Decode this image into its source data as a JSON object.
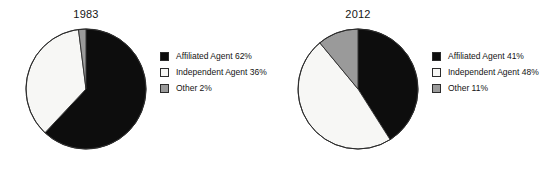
{
  "figure": {
    "background_color": "#ffffff",
    "palette": {
      "affiliated_agent": "#0d0d0d",
      "independent_agent": "#f7f7f5",
      "other": "#9a9a9a",
      "outline": "#2b2b2b",
      "text": "#141414"
    }
  },
  "chart_data": [
    {
      "type": "pie",
      "title": "1983",
      "xlabel": "",
      "ylabel": "",
      "grid": false,
      "legend_position": "right",
      "start_angle_clock": "12 o'clock",
      "direction": "clockwise",
      "labels": [
        "Affiliated Agent",
        "Independent Agent",
        "Other"
      ],
      "values": [
        62,
        36,
        2
      ],
      "units": "percent",
      "colors": [
        "#0d0d0d",
        "#f7f7f5",
        "#9a9a9a"
      ],
      "legend_entries": [
        "Affiliated Agent 62%",
        "Independent Agent 36%",
        "Other 2%"
      ],
      "slices": [
        {
          "label": "Affiliated Agent",
          "value": 62,
          "display": "Affiliated Agent 62%",
          "color": "#0d0d0d"
        },
        {
          "label": "Independent Agent",
          "value": 36,
          "display": "Independent Agent 36%",
          "color": "#f7f7f5"
        },
        {
          "label": "Other",
          "value": 2,
          "display": "Other 2%",
          "color": "#9a9a9a"
        }
      ]
    },
    {
      "type": "pie",
      "title": "2012",
      "xlabel": "",
      "ylabel": "",
      "grid": false,
      "legend_position": "right",
      "start_angle_clock": "12 o'clock",
      "direction": "clockwise",
      "labels": [
        "Affiliated Agent",
        "Independent Agent",
        "Other"
      ],
      "values": [
        41,
        48,
        11
      ],
      "units": "percent",
      "colors": [
        "#0d0d0d",
        "#f7f7f5",
        "#9a9a9a"
      ],
      "legend_entries": [
        "Affiliated Agent 41%",
        "Independent Agent 48%",
        "Other 11%"
      ],
      "slices": [
        {
          "label": "Affiliated Agent",
          "value": 41,
          "display": "Affiliated Agent 41%",
          "color": "#0d0d0d"
        },
        {
          "label": "Independent Agent",
          "value": 48,
          "display": "Independent Agent 48%",
          "color": "#f7f7f5"
        },
        {
          "label": "Other",
          "value": 11,
          "display": "Other 11%",
          "color": "#9a9a9a"
        }
      ]
    }
  ]
}
